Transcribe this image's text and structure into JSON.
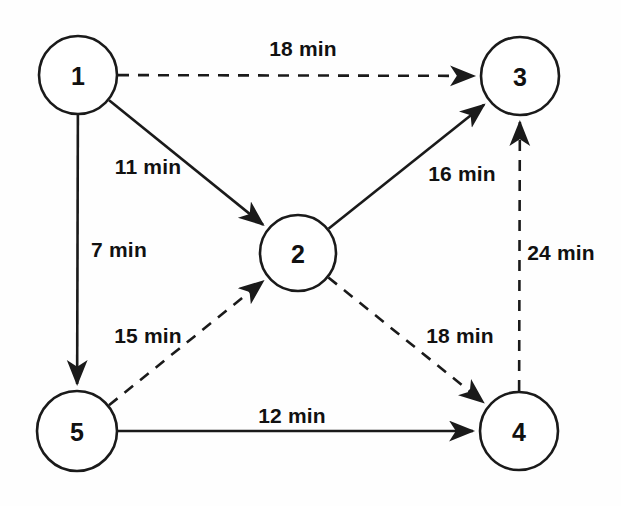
{
  "diagram": {
    "unit": "min",
    "colors": {
      "background": "#fefefe",
      "stroke": "#1a1a1a",
      "node_fill": "#ffffff",
      "text": "#111111"
    },
    "nodes": [
      {
        "id": "1",
        "label": "1",
        "cx": 78,
        "cy": 75,
        "r": 39
      },
      {
        "id": "2",
        "label": "2",
        "cx": 298,
        "cy": 253,
        "r": 38
      },
      {
        "id": "3",
        "label": "3",
        "cx": 520,
        "cy": 76,
        "r": 39
      },
      {
        "id": "4",
        "label": "4",
        "cx": 519,
        "cy": 431,
        "r": 39
      },
      {
        "id": "5",
        "label": "5",
        "cx": 77,
        "cy": 431,
        "r": 40
      }
    ],
    "edges": [
      {
        "id": "e1-3",
        "from": "1",
        "to": "3",
        "style": "dashed",
        "label": "18 min",
        "label_x": 303,
        "label_y": 48
      },
      {
        "id": "e1-2",
        "from": "1",
        "to": "2",
        "style": "solid",
        "label": "11 min",
        "label_x": 148,
        "label_y": 166
      },
      {
        "id": "e1-5",
        "from": "1",
        "to": "5",
        "style": "solid",
        "label": "7 min",
        "label_x": 119,
        "label_y": 249
      },
      {
        "id": "e2-3",
        "from": "2",
        "to": "3",
        "style": "solid",
        "label": "16 min",
        "label_x": 462,
        "label_y": 173
      },
      {
        "id": "e4-3",
        "from": "4",
        "to": "3",
        "style": "dashed",
        "label": "24 min",
        "label_x": 561,
        "label_y": 252
      },
      {
        "id": "e5-2",
        "from": "5",
        "to": "2",
        "style": "dashed",
        "label": "15 min",
        "label_x": 148,
        "label_y": 335
      },
      {
        "id": "e2-4",
        "from": "2",
        "to": "4",
        "style": "dashed",
        "label": "18 min",
        "label_x": 460,
        "label_y": 335
      },
      {
        "id": "e5-4",
        "from": "5",
        "to": "4",
        "style": "solid",
        "label": "12 min",
        "label_x": 292,
        "label_y": 415
      }
    ]
  }
}
